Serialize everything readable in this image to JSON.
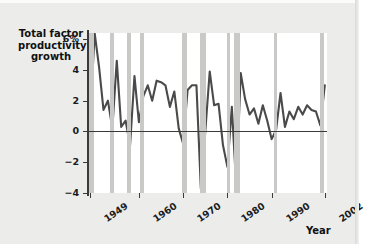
{
  "chart_data": {
    "type": "line",
    "title": "",
    "xlabel": "Year",
    "ylabel": "Total factor productivity growth",
    "ylabel_lines": [
      "Total factor",
      "productivity",
      "growth"
    ],
    "xlim": [
      1948.5,
      2002.5
    ],
    "ylim": [
      -4,
      6.4
    ],
    "grid": false,
    "legend": null,
    "y_ticks": [
      6,
      4,
      2,
      0,
      -2,
      -4
    ],
    "y_tick_labels": [
      "6%",
      "4",
      "2",
      "0",
      "−2",
      "−4"
    ],
    "x_ticks": [
      1949,
      1960,
      1970,
      1980,
      1990,
      2002
    ],
    "x_tick_labels": [
      "1949",
      "1960",
      "1970",
      "1980",
      "1990",
      "2002"
    ],
    "series": [
      {
        "name": "Total factor productivity growth",
        "color": "#4a4a4a",
        "x": [
          1949,
          1950,
          1951,
          1952,
          1953,
          1954,
          1955,
          1956,
          1957,
          1958,
          1959,
          1960,
          1961,
          1962,
          1963,
          1964,
          1965,
          1966,
          1967,
          1968,
          1969,
          1970,
          1971,
          1972,
          1973,
          1974,
          1975,
          1976,
          1977,
          1978,
          1979,
          1980,
          1981,
          1982,
          1983,
          1984,
          1985,
          1986,
          1987,
          1988,
          1989,
          1990,
          1991,
          1992,
          1993,
          1994,
          1995,
          1996,
          1997,
          1998,
          1999,
          2000,
          2001,
          2002
        ],
        "values": [
          0.9,
          6.4,
          4.2,
          1.4,
          2.0,
          0.2,
          4.6,
          0.3,
          0.7,
          -0.9,
          3.6,
          0.6,
          2.3,
          3.0,
          2.0,
          3.3,
          3.2,
          3.0,
          1.6,
          2.6,
          0.2,
          -0.8,
          2.7,
          3.0,
          3.0,
          -3.7,
          0.0,
          3.9,
          1.7,
          1.8,
          -0.9,
          -2.3,
          1.6,
          -3.6,
          3.8,
          2.1,
          1.1,
          1.5,
          0.5,
          1.7,
          0.7,
          -0.5,
          0.1,
          2.5,
          0.3,
          1.3,
          0.8,
          1.6,
          1.1,
          1.7,
          1.4,
          1.3,
          0.4,
          3.0
        ]
      }
    ],
    "recession_bands": {
      "color": "#c9c9c7",
      "label": "recession",
      "spans": [
        [
          1948.8,
          1949.8
        ],
        [
          1953.5,
          1954.4
        ],
        [
          1957.4,
          1958.3
        ],
        [
          1960.3,
          1961.1
        ],
        [
          1969.8,
          1970.8
        ],
        [
          1973.8,
          1975.1
        ],
        [
          1980.0,
          1980.6
        ],
        [
          1981.5,
          1982.8
        ],
        [
          1990.5,
          1991.2
        ],
        [
          2001.0,
          2001.8
        ]
      ]
    },
    "axis_color": "#3a3a3a",
    "plot_background": "#ffffff",
    "figure_background": "#ececeb"
  }
}
